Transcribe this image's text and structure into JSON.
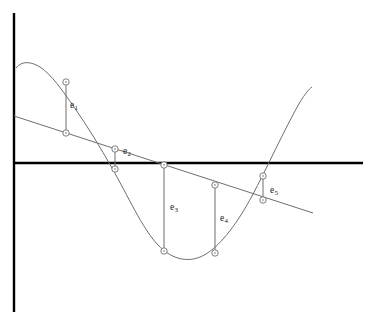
{
  "figure": {
    "background_color": "#ffffff",
    "width": 373,
    "height": 332
  },
  "axes": {
    "axis_color": "#000000",
    "axis_width": 2.4,
    "y_axis": {
      "name": "vertical-axis",
      "x": 14,
      "y_top": 13,
      "y_bottom": 312
    },
    "x_axis": {
      "name": "horizontal-axis",
      "y": 163,
      "x_left": 14,
      "x_right": 363
    },
    "origin": {
      "x": 14,
      "y": 163
    }
  },
  "curves": {
    "data_curve": {
      "name": "sinusoidal-data-curve",
      "color": "#6e6e6e",
      "width": 1,
      "path": "M 16 68 C 22 60 32 62 40 67 C 52 75 62 90 74 107 C 88 127 100 147 112 168 C 128 196 142 228 158 245 C 172 260 190 264 206 254 C 222 244 238 222 252 196 C 266 170 284 130 300 102 C 305 94 309 89 312 87"
    },
    "regression_line": {
      "name": "least-squares-regression-line",
      "color": "#6e6e6e",
      "width": 1,
      "x1": 14,
      "y1": 116,
      "x2": 313,
      "y2": 213
    }
  },
  "marker_style": {
    "name": "data-point-circle",
    "radius": 3.2,
    "stroke": "#6e6e6e",
    "fill": "#ffffff",
    "inner_dot_radius": 0.8,
    "inner_dot_color": "#6e6e6e"
  },
  "residuals": [
    {
      "id": "e1",
      "label": "e",
      "subscript": "1",
      "x": 66,
      "y_curve": 82,
      "y_line": 133,
      "label_x": 70,
      "label_y": 101,
      "length": 51
    },
    {
      "id": "e2",
      "label": "e",
      "subscript": "2",
      "x": 115,
      "y_curve": 169,
      "y_line": 149,
      "label_x": 123,
      "label_y": 147,
      "length": 20
    },
    {
      "id": "e3",
      "label": "e",
      "subscript": "3",
      "x": 164,
      "y_curve": 251,
      "y_line": 165,
      "label_x": 170,
      "label_y": 203,
      "length": 86
    },
    {
      "id": "e4",
      "label": "e",
      "subscript": "4",
      "x": 215,
      "y_curve": 253,
      "y_line": 185,
      "label_x": 220,
      "label_y": 214,
      "length": 68
    },
    {
      "id": "e5",
      "label": "e",
      "subscript": "5",
      "x": 263,
      "y_curve": 176,
      "y_line": 200,
      "label_x": 270,
      "label_y": 186,
      "length": 24
    }
  ],
  "chart_data": {
    "type": "line",
    "title": "",
    "xlabel": "",
    "ylabel": "",
    "grid": false,
    "legend": null,
    "axis_ranges": {
      "x_pixel": [
        14,
        363
      ],
      "y_pixel": [
        13,
        312
      ],
      "zero_line_y_pixel": 163
    },
    "series": [
      {
        "name": "data curve (sinusoid)",
        "style": "smooth-curve",
        "color": "#6e6e6e",
        "points_pixel": [
          [
            16,
            68
          ],
          [
            40,
            67
          ],
          [
            74,
            107
          ],
          [
            112,
            168
          ],
          [
            158,
            245
          ],
          [
            190,
            260
          ],
          [
            206,
            254
          ],
          [
            252,
            196
          ],
          [
            300,
            102
          ],
          [
            312,
            87
          ]
        ]
      },
      {
        "name": "fitted straight line",
        "style": "straight-line",
        "color": "#6e6e6e",
        "points_pixel": [
          [
            14,
            116
          ],
          [
            313,
            213
          ]
        ]
      }
    ],
    "annotations": [
      {
        "text": "e1",
        "x_pixel": 70,
        "y_pixel": 101
      },
      {
        "text": "e2",
        "x_pixel": 123,
        "y_pixel": 147
      },
      {
        "text": "e3",
        "x_pixel": 170,
        "y_pixel": 203
      },
      {
        "text": "e4",
        "x_pixel": 220,
        "y_pixel": 214
      },
      {
        "text": "e5",
        "x_pixel": 270,
        "y_pixel": 186
      }
    ],
    "residual_segments": [
      {
        "label": "e1",
        "x_pixel": 66,
        "y_top_pixel": 82,
        "y_bottom_pixel": 133
      },
      {
        "label": "e2",
        "x_pixel": 115,
        "y_top_pixel": 149,
        "y_bottom_pixel": 169
      },
      {
        "label": "e3",
        "x_pixel": 164,
        "y_top_pixel": 165,
        "y_bottom_pixel": 251
      },
      {
        "label": "e4",
        "x_pixel": 215,
        "y_top_pixel": 185,
        "y_bottom_pixel": 253
      },
      {
        "label": "e5",
        "x_pixel": 263,
        "y_top_pixel": 176,
        "y_bottom_pixel": 200
      }
    ]
  }
}
